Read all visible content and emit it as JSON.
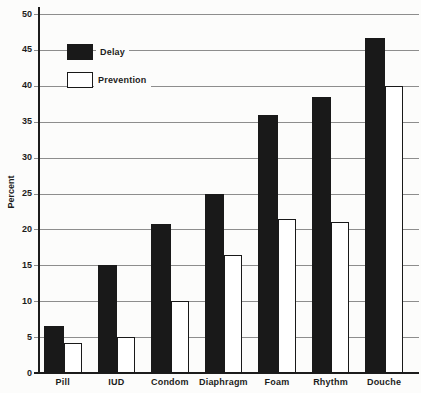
{
  "chart_data": {
    "type": "bar",
    "title": "",
    "xlabel": "",
    "ylabel": "Percent",
    "ylim": [
      0,
      50
    ],
    "yticks": [
      0,
      5,
      10,
      15,
      20,
      25,
      30,
      35,
      40,
      45,
      50
    ],
    "grid": "horizontal-gray-lines",
    "legend_position": "top-left-inside",
    "categories": [
      "Pill",
      "IUD",
      "Condom",
      "Diaphragm",
      "Foam",
      "Rhythm",
      "Douche"
    ],
    "series": [
      {
        "name": "Delay",
        "color": "#191919",
        "values": [
          6.5,
          15,
          20.7,
          25,
          36,
          38.5,
          46.7
        ]
      },
      {
        "name": "Prevention",
        "color": "#ffffff",
        "values": [
          4.2,
          5,
          10,
          16.5,
          21.5,
          21,
          40
        ]
      }
    ],
    "colors": {
      "delay_bar": "#191919",
      "prevention_bar": "#ffffff",
      "bar_outline": "#191919",
      "gridline": "#8d8d8d",
      "axis": "#1c1c1c",
      "background": "#fcfcfb",
      "text": "#1c1c1c"
    }
  }
}
